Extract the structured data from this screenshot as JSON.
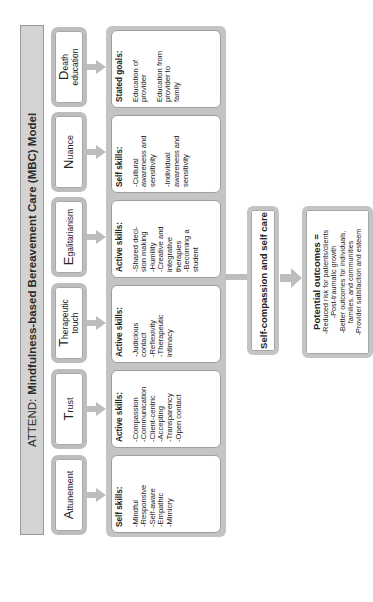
{
  "title": {
    "prefix": "ATTEND:",
    "main": "Mindfulness-based Bereavement Care (MBC) Model"
  },
  "columns": [
    {
      "cap": "A",
      "rest": "ttunement",
      "card": {
        "heading": "Self skills:",
        "items": [
          "-Mindful",
          "-Responsive",
          "-Self-aware",
          "-Empathic",
          "-Mimicry"
        ]
      }
    },
    {
      "cap": "T",
      "rest": "rust",
      "card": {
        "heading": "Active skills:",
        "items": [
          "-Compassion",
          "-Communication",
          "-Client-centric",
          "-Accepting",
          "-Transparency",
          "-Open contact"
        ]
      }
    },
    {
      "cap": "T",
      "rest": "herapeutic",
      "line2": "touch",
      "card": {
        "heading": "Active skills:",
        "items": [
          "-Judicious",
          "contact",
          "-Reflexivity",
          "-Therapeutic",
          "intimacy"
        ]
      }
    },
    {
      "cap": "E",
      "rest": "galitarianism",
      "card": {
        "heading": "Active skills:",
        "items": [
          "-Shared deci-",
          "sion making",
          "-Humility",
          "-Creative and",
          "integrative",
          "therapies",
          "-Becoming a",
          "student"
        ]
      }
    },
    {
      "cap": "N",
      "rest": "uance",
      "card": {
        "heading": "Self skills:",
        "items": [
          "-Cultural",
          "awareness and",
          "sensitivity",
          "",
          "-Individual",
          "awareness and",
          "sensitivity"
        ]
      }
    },
    {
      "cap": "D",
      "rest": "eath",
      "line2": "education",
      "card": {
        "heading": "Stated goals:",
        "items": [
          "Education of",
          "provider",
          "",
          "Education from",
          "provider to",
          "family"
        ]
      }
    }
  ],
  "self_care": {
    "label": "Self-compassion and self care"
  },
  "outcomes": {
    "heading": "Potential outcomes =",
    "items": [
      "-Reduced risk for patients/clients",
      "-Post-traumatic growth",
      "-Better outcomes for individuals,",
      "families, and communities",
      "-Provider satisfaction and esteem"
    ]
  },
  "colors": {
    "title_fill": "#d3d3d3",
    "container_fill": "#c4c4c4",
    "arrow": "#bdbdbd",
    "card_fill": "#ffffff"
  }
}
